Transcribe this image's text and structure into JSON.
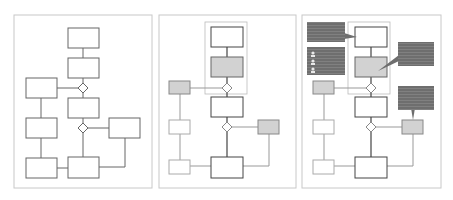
{
  "figure": {
    "panels": [
      {
        "id": "panel-1",
        "label": "Flowchart plain",
        "x": 14,
        "y": 15,
        "w": 138,
        "h": 173
      },
      {
        "id": "panel-2",
        "label": "Flowchart with highlighted nodes",
        "x": 159,
        "y": 15,
        "w": 137,
        "h": 173
      },
      {
        "id": "panel-3",
        "label": "Flowchart with annotation callouts",
        "x": 302,
        "y": 15,
        "w": 139,
        "h": 173
      }
    ],
    "colors": {
      "panel_border": "#c8c8c8",
      "node_border": "#555555",
      "node_border_light": "#999999",
      "node_fill_highlight": "#d2d2d2",
      "callout_fill": "#6e6e6e",
      "callout_lines": "#9a9a9a",
      "group_border": "#bbbbbb"
    }
  }
}
